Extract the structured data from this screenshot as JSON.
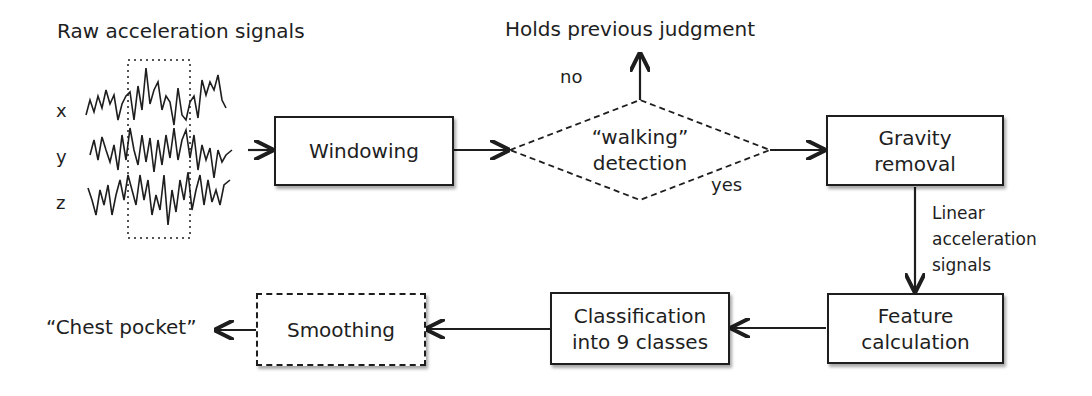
{
  "input": {
    "title": "Raw acceleration signals",
    "axes": [
      "x",
      "y",
      "z"
    ]
  },
  "nodes": {
    "windowing": "Windowing",
    "walking_detection": {
      "line1": "“walking”",
      "line2": "detection"
    },
    "gravity_removal": {
      "line1": "Gravity",
      "line2": "removal"
    },
    "feature_calculation": {
      "line1": "Feature",
      "line2": "calculation"
    },
    "classification": {
      "line1": "Classification",
      "line2": "into 9 classes"
    },
    "smoothing": "Smoothing"
  },
  "edges": {
    "no_label": "no",
    "yes_label": "yes",
    "no_target": "Holds previous judgment",
    "linear_signals": {
      "line1": "Linear",
      "line2": "acceleration",
      "line3": "signals"
    }
  },
  "output": "“Chest pocket”"
}
